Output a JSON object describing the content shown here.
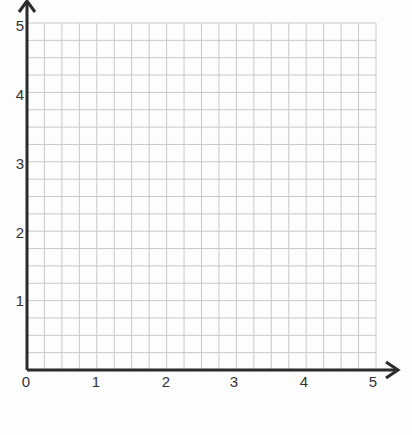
{
  "chart_data": {
    "type": "scatter",
    "title": "",
    "xlabel": "",
    "ylabel": "",
    "x_ticks": [
      "0",
      "1",
      "2",
      "3",
      "4",
      "5"
    ],
    "y_ticks": [
      "1",
      "2",
      "3",
      "4",
      "5"
    ],
    "xlim": [
      0,
      5
    ],
    "ylim": [
      0,
      5
    ],
    "grid": true,
    "grid_subdivisions_per_unit": 4,
    "series": [],
    "axis_arrows": true
  },
  "colors": {
    "axis": "#2b2b2b",
    "grid": "#c8c8c8",
    "background": "#fdfdfd"
  }
}
